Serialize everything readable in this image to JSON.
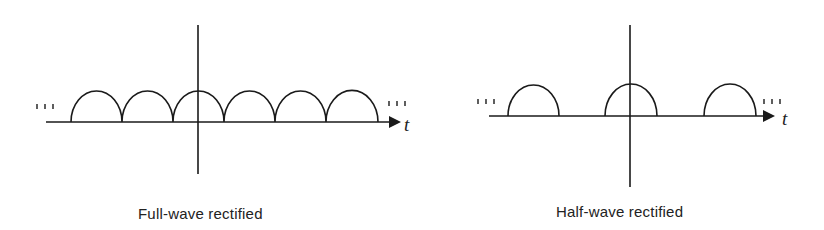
{
  "figures": [
    {
      "id": "full-wave",
      "caption": "Full-wave rectified",
      "axis_label": "t",
      "continuation_marks": "...",
      "description": "Absolute value of a sinusoid: contiguous half-sine arches, no gaps"
    },
    {
      "id": "half-wave",
      "caption": "Half-wave rectified",
      "axis_label": "t",
      "continuation_marks": "...",
      "description": "Half-sine arches separated by zero intervals of equal length"
    }
  ],
  "colors": {
    "stroke": "#1a1a1a",
    "background": "#ffffff"
  }
}
